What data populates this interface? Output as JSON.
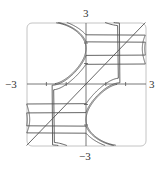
{
  "chart_data": {
    "type": "line",
    "title": "",
    "xlabel": "",
    "ylabel": "",
    "xlim": [
      -3,
      3
    ],
    "ylim": [
      -3,
      3
    ],
    "grid": false,
    "ticks_every": 1,
    "level_values": [
      -10.4,
      -9.85,
      -7.8,
      0,
      7.8,
      9.85,
      10.4
    ],
    "series": [
      {
        "name": "c=0 (diagonal y=x)",
        "points": [
          [
            -3,
            -3
          ],
          [
            3,
            3
          ]
        ]
      },
      {
        "name": "upper-left curves y-axis crossings",
        "values": [
          1.65,
          2.05,
          2.4
        ]
      },
      {
        "name": "lower-right curves x-axis crossings",
        "values": [
          1.65,
          1.95,
          2.3
        ]
      }
    ],
    "tick_labels": {
      "x_min": "−3",
      "x_max": "3",
      "y_min": "−3",
      "y_max": "3"
    }
  },
  "labels": {
    "top": "3",
    "bottom": "−3",
    "left": "−3",
    "right": "3"
  },
  "colors": {
    "curve": "#555555",
    "frame": "#bbbbbb",
    "axis": "#555555"
  }
}
